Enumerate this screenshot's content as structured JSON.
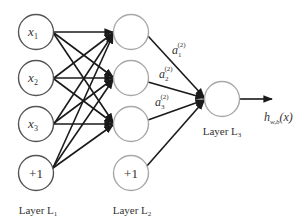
{
  "diagram": {
    "type": "feedforward-neural-network",
    "colors": {
      "input_node_stroke": "#555555",
      "hidden_node_stroke": "#a8a8a8",
      "edge": "#1a1a1a",
      "text": "#333333"
    },
    "layers": [
      {
        "id": "L1",
        "label_main": "Layer L",
        "label_sub": "1",
        "nodes": [
          {
            "id": "x1",
            "text": "x",
            "sub": "1",
            "italic": true
          },
          {
            "id": "x2",
            "text": "x",
            "sub": "2",
            "italic": true
          },
          {
            "id": "x3",
            "text": "x",
            "sub": "3",
            "italic": true
          },
          {
            "id": "b1",
            "text": "+1",
            "sub": "",
            "italic": false
          }
        ]
      },
      {
        "id": "L2",
        "label_main": "Layer L",
        "label_sub": "2",
        "nodes": [
          {
            "id": "h1",
            "text": ""
          },
          {
            "id": "h2",
            "text": ""
          },
          {
            "id": "h3",
            "text": ""
          },
          {
            "id": "b2",
            "text": "+1"
          }
        ]
      },
      {
        "id": "L3",
        "label_main": "Layer L",
        "label_sub": "3",
        "nodes": [
          {
            "id": "o1",
            "text": ""
          }
        ]
      }
    ],
    "activations": [
      {
        "base": "a",
        "sub": "1",
        "sup": "(2)"
      },
      {
        "base": "a",
        "sub": "2",
        "sup": "(2)"
      },
      {
        "base": "a",
        "sub": "3",
        "sup": "(2)"
      }
    ],
    "output": {
      "base": "h",
      "sub": "w,b",
      "arg": "(x)"
    }
  }
}
